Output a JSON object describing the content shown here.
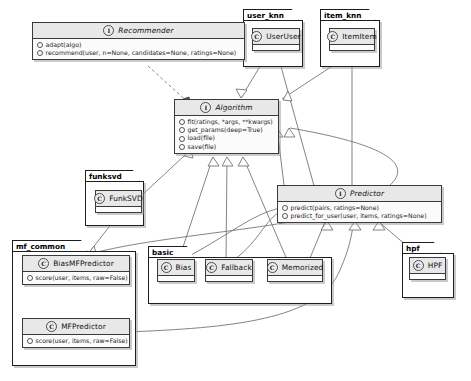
{
  "diagram": {
    "type": "uml-class-diagram",
    "icons": {
      "interface": "I",
      "class": "C",
      "member": "member-dot"
    },
    "colors": {
      "background": "#ffffff",
      "box_fill": "#ffffff",
      "header_fill": "#e8e8e8",
      "border": "#3a3a3a",
      "package_border": "#1d1d1d",
      "edge": "#6b6b6b"
    }
  },
  "classes": [
    {
      "id": "recommender",
      "name": "Recommender",
      "stereotype": "interface",
      "icon": "I",
      "members": [
        "adapt(algo)",
        "recommend(user, n=None, candidates=None, ratings=None)"
      ]
    },
    {
      "id": "algorithm",
      "name": "Algorithm",
      "stereotype": "interface",
      "icon": "I",
      "members": [
        "fit(ratings, *args, **kwargs)",
        "get_params(deep=True)",
        "load(file)",
        "save(file)"
      ]
    },
    {
      "id": "predictor",
      "name": "Predictor",
      "stereotype": "interface",
      "icon": "I",
      "members": [
        "predict(pairs, ratings=None)",
        "predict_for_user(user, items, ratings=None)"
      ]
    },
    {
      "id": "useruser",
      "name": "UserUser",
      "stereotype": "class",
      "icon": "C",
      "members": []
    },
    {
      "id": "itemitem",
      "name": "ItemItem",
      "stereotype": "class",
      "icon": "C",
      "members": []
    },
    {
      "id": "funksvd",
      "name": "FunkSVD",
      "stereotype": "class",
      "icon": "C",
      "members": []
    },
    {
      "id": "bias",
      "name": "Bias",
      "stereotype": "class",
      "icon": "C",
      "members": []
    },
    {
      "id": "fallback",
      "name": "Fallback",
      "stereotype": "class",
      "icon": "C",
      "members": []
    },
    {
      "id": "memorized",
      "name": "Memorized",
      "stereotype": "class",
      "icon": "C",
      "members": []
    },
    {
      "id": "hpf",
      "name": "HPF",
      "stereotype": "class",
      "icon": "C",
      "members": []
    },
    {
      "id": "biasmfpredictor",
      "name": "BiasMFPredictor",
      "stereotype": "class",
      "icon": "C",
      "members": [
        "score(user, items, raw=False)"
      ]
    },
    {
      "id": "mfpredictor",
      "name": "MFPredictor",
      "stereotype": "class",
      "icon": "C",
      "members": [
        "score(user, items, raw=False)"
      ]
    }
  ],
  "packages": [
    {
      "id": "user_knn",
      "name": "user_knn",
      "contains": [
        "useruser"
      ]
    },
    {
      "id": "item_knn",
      "name": "item_knn",
      "contains": [
        "itemitem"
      ]
    },
    {
      "id": "funksvd_pkg",
      "name": "funksvd",
      "contains": [
        "funksvd"
      ]
    },
    {
      "id": "mf_common",
      "name": "mf_common",
      "contains": [
        "biasmfpredictor",
        "mfpredictor"
      ]
    },
    {
      "id": "basic",
      "name": "basic",
      "contains": [
        "bias",
        "fallback",
        "memorized"
      ]
    },
    {
      "id": "hpf_pkg",
      "name": "hpf",
      "contains": [
        "hpf"
      ]
    }
  ],
  "relations": [
    {
      "from": "recommender",
      "to": "algorithm",
      "type": "dependency"
    },
    {
      "from": "useruser",
      "to": "algorithm",
      "type": "generalization"
    },
    {
      "from": "itemitem",
      "to": "algorithm",
      "type": "generalization"
    },
    {
      "from": "funksvd",
      "to": "algorithm",
      "type": "generalization"
    },
    {
      "from": "bias",
      "to": "algorithm",
      "type": "generalization"
    },
    {
      "from": "fallback",
      "to": "algorithm",
      "type": "generalization"
    },
    {
      "from": "memorized",
      "to": "algorithm",
      "type": "generalization"
    },
    {
      "from": "predictor",
      "to": "algorithm",
      "type": "generalization"
    },
    {
      "from": "biasmfpredictor",
      "to": "algorithm",
      "type": "generalization"
    },
    {
      "from": "useruser",
      "to": "predictor",
      "type": "generalization"
    },
    {
      "from": "itemitem",
      "to": "predictor",
      "type": "generalization"
    },
    {
      "from": "bias",
      "to": "predictor",
      "type": "generalization"
    },
    {
      "from": "fallback",
      "to": "predictor",
      "type": "generalization"
    },
    {
      "from": "memorized",
      "to": "predictor",
      "type": "generalization"
    },
    {
      "from": "hpf",
      "to": "predictor",
      "type": "generalization"
    },
    {
      "from": "mfpredictor",
      "to": "predictor",
      "type": "generalization"
    },
    {
      "from": "funksvd",
      "to": "biasmfpredictor",
      "type": "generalization"
    },
    {
      "from": "biasmfpredictor",
      "to": "mfpredictor",
      "type": "generalization"
    }
  ]
}
